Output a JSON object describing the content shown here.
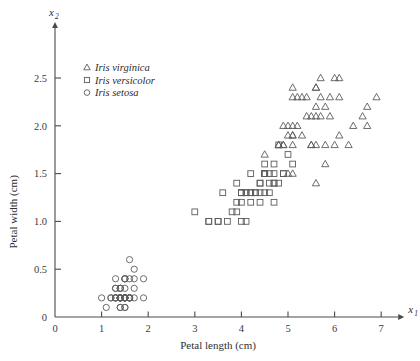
{
  "figure": {
    "background_color": "#ffffff",
    "marker_color": "#5c5c5c",
    "axis_color": "#4a4a4a"
  },
  "axes": {
    "x_variable": "x",
    "x_variable_sub": "1",
    "y_variable": "x",
    "y_variable_sub": "2"
  },
  "legend": {
    "items": [
      {
        "label": "Iris virginica",
        "marker": "triangle"
      },
      {
        "label": "Iris versicolor",
        "marker": "square"
      },
      {
        "label": "Iris setosa",
        "marker": "circle"
      }
    ]
  },
  "chart_data": {
    "type": "scatter",
    "title": "",
    "xlabel": "Petal length (cm)",
    "ylabel": "Petal width (cm)",
    "xlim": [
      0,
      7.3
    ],
    "ylim": [
      0,
      2.75
    ],
    "xticks": [
      0,
      1,
      2,
      3,
      4,
      5,
      6,
      7
    ],
    "xtick_labels": [
      "0",
      "1",
      "2",
      "3",
      "4",
      "5",
      "6",
      "7"
    ],
    "yticks": [
      0,
      0.5,
      1.0,
      1.5,
      2.0,
      2.5
    ],
    "ytick_labels": [
      "0",
      "0.5",
      "1.0",
      "1.5",
      "2.0",
      "2.5"
    ],
    "grid": false,
    "legend_position": "upper-left",
    "series": [
      {
        "name": "Iris setosa",
        "marker": "circle",
        "points": [
          [
            1.4,
            0.2
          ],
          [
            1.4,
            0.2
          ],
          [
            1.3,
            0.2
          ],
          [
            1.5,
            0.2
          ],
          [
            1.4,
            0.2
          ],
          [
            1.7,
            0.4
          ],
          [
            1.4,
            0.3
          ],
          [
            1.5,
            0.2
          ],
          [
            1.4,
            0.2
          ],
          [
            1.5,
            0.1
          ],
          [
            1.5,
            0.2
          ],
          [
            1.6,
            0.2
          ],
          [
            1.4,
            0.1
          ],
          [
            1.1,
            0.1
          ],
          [
            1.2,
            0.2
          ],
          [
            1.5,
            0.4
          ],
          [
            1.3,
            0.4
          ],
          [
            1.4,
            0.3
          ],
          [
            1.7,
            0.3
          ],
          [
            1.5,
            0.3
          ],
          [
            1.7,
            0.2
          ],
          [
            1.5,
            0.4
          ],
          [
            1.0,
            0.2
          ],
          [
            1.7,
            0.5
          ],
          [
            1.9,
            0.2
          ],
          [
            1.6,
            0.2
          ],
          [
            1.6,
            0.4
          ],
          [
            1.5,
            0.2
          ],
          [
            1.4,
            0.2
          ],
          [
            1.6,
            0.2
          ],
          [
            1.6,
            0.2
          ],
          [
            1.5,
            0.4
          ],
          [
            1.5,
            0.1
          ],
          [
            1.4,
            0.2
          ],
          [
            1.5,
            0.2
          ],
          [
            1.2,
            0.2
          ],
          [
            1.3,
            0.2
          ],
          [
            1.4,
            0.1
          ],
          [
            1.3,
            0.2
          ],
          [
            1.5,
            0.2
          ],
          [
            1.3,
            0.3
          ],
          [
            1.3,
            0.3
          ],
          [
            1.3,
            0.2
          ],
          [
            1.6,
            0.6
          ],
          [
            1.9,
            0.4
          ],
          [
            1.4,
            0.3
          ],
          [
            1.6,
            0.2
          ],
          [
            1.4,
            0.2
          ],
          [
            1.5,
            0.2
          ],
          [
            1.4,
            0.2
          ]
        ]
      },
      {
        "name": "Iris versicolor",
        "marker": "square",
        "points": [
          [
            4.7,
            1.4
          ],
          [
            4.5,
            1.5
          ],
          [
            4.9,
            1.5
          ],
          [
            4.0,
            1.3
          ],
          [
            4.6,
            1.5
          ],
          [
            4.5,
            1.3
          ],
          [
            4.7,
            1.6
          ],
          [
            3.3,
            1.0
          ],
          [
            4.6,
            1.3
          ],
          [
            3.9,
            1.4
          ],
          [
            3.5,
            1.0
          ],
          [
            4.2,
            1.5
          ],
          [
            4.0,
            1.0
          ],
          [
            4.7,
            1.4
          ],
          [
            3.6,
            1.3
          ],
          [
            4.4,
            1.4
          ],
          [
            4.5,
            1.5
          ],
          [
            4.1,
            1.0
          ],
          [
            4.5,
            1.5
          ],
          [
            3.9,
            1.1
          ],
          [
            4.8,
            1.8
          ],
          [
            4.0,
            1.3
          ],
          [
            4.9,
            1.5
          ],
          [
            4.7,
            1.2
          ],
          [
            4.3,
            1.3
          ],
          [
            4.4,
            1.4
          ],
          [
            4.8,
            1.4
          ],
          [
            5.0,
            1.7
          ],
          [
            4.5,
            1.5
          ],
          [
            3.5,
            1.0
          ],
          [
            3.8,
            1.1
          ],
          [
            3.7,
            1.0
          ],
          [
            3.9,
            1.2
          ],
          [
            5.1,
            1.6
          ],
          [
            4.5,
            1.5
          ],
          [
            4.5,
            1.6
          ],
          [
            4.7,
            1.5
          ],
          [
            4.4,
            1.3
          ],
          [
            4.1,
            1.3
          ],
          [
            4.0,
            1.3
          ],
          [
            4.4,
            1.2
          ],
          [
            4.6,
            1.4
          ],
          [
            4.0,
            1.2
          ],
          [
            3.3,
            1.0
          ],
          [
            4.2,
            1.3
          ],
          [
            4.2,
            1.2
          ],
          [
            4.2,
            1.3
          ],
          [
            4.3,
            1.3
          ],
          [
            3.0,
            1.1
          ],
          [
            4.1,
            1.3
          ]
        ]
      },
      {
        "name": "Iris virginica",
        "marker": "triangle",
        "points": [
          [
            6.0,
            2.5
          ],
          [
            5.1,
            1.9
          ],
          [
            5.9,
            2.1
          ],
          [
            5.6,
            1.8
          ],
          [
            5.8,
            2.2
          ],
          [
            6.6,
            2.1
          ],
          [
            4.5,
            1.7
          ],
          [
            6.3,
            1.8
          ],
          [
            5.8,
            1.8
          ],
          [
            6.1,
            2.5
          ],
          [
            5.1,
            2.0
          ],
          [
            5.3,
            1.9
          ],
          [
            5.5,
            2.1
          ],
          [
            5.0,
            2.0
          ],
          [
            5.1,
            2.4
          ],
          [
            5.3,
            2.3
          ],
          [
            5.5,
            1.8
          ],
          [
            6.7,
            2.2
          ],
          [
            6.9,
            2.3
          ],
          [
            5.0,
            1.5
          ],
          [
            5.7,
            2.3
          ],
          [
            4.9,
            2.0
          ],
          [
            6.7,
            2.0
          ],
          [
            4.9,
            1.8
          ],
          [
            5.7,
            2.1
          ],
          [
            6.0,
            1.8
          ],
          [
            4.8,
            1.8
          ],
          [
            4.9,
            1.8
          ],
          [
            5.6,
            2.1
          ],
          [
            5.8,
            1.6
          ],
          [
            6.1,
            1.9
          ],
          [
            6.4,
            2.0
          ],
          [
            5.6,
            2.2
          ],
          [
            5.1,
            1.5
          ],
          [
            5.6,
            1.4
          ],
          [
            6.1,
            2.3
          ],
          [
            5.6,
            2.4
          ],
          [
            5.5,
            1.8
          ],
          [
            4.8,
            1.8
          ],
          [
            5.4,
            2.1
          ],
          [
            5.6,
            2.4
          ],
          [
            5.1,
            2.3
          ],
          [
            5.1,
            1.9
          ],
          [
            5.9,
            2.3
          ],
          [
            5.7,
            2.5
          ],
          [
            5.2,
            2.3
          ],
          [
            5.0,
            1.9
          ],
          [
            5.2,
            2.0
          ],
          [
            5.4,
            2.3
          ],
          [
            5.1,
            1.8
          ]
        ]
      }
    ]
  }
}
